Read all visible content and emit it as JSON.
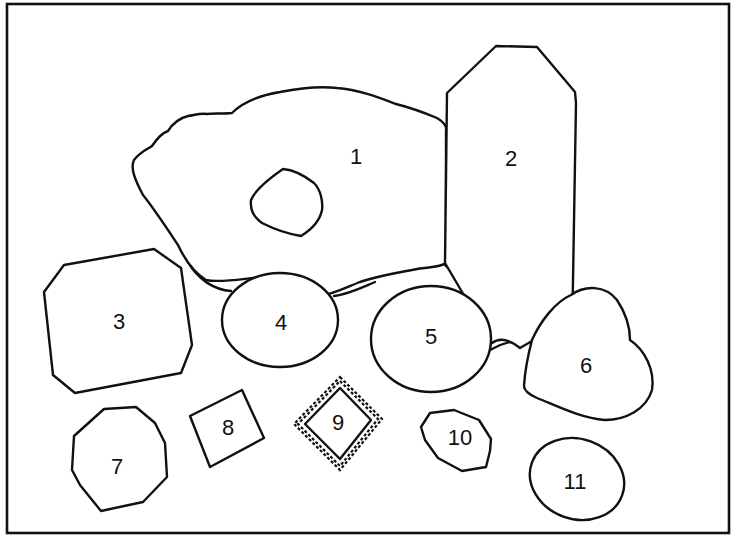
{
  "figure": {
    "frame_color": "#111111",
    "background": "#ffffff",
    "shapes": [
      {
        "id": "1",
        "label": "1",
        "description": "large irregular blob with inner hole"
      },
      {
        "id": "2",
        "label": "2",
        "description": "tall elongated octagon"
      },
      {
        "id": "3",
        "label": "3",
        "description": "large octagon with clipped corners"
      },
      {
        "id": "4",
        "label": "4",
        "description": "ellipse"
      },
      {
        "id": "5",
        "label": "5",
        "description": "ellipse"
      },
      {
        "id": "6",
        "label": "6",
        "description": "heart shape"
      },
      {
        "id": "7",
        "label": "7",
        "description": "irregular polygon"
      },
      {
        "id": "8",
        "label": "8",
        "description": "tilted square"
      },
      {
        "id": "9",
        "label": "9",
        "description": "diamond with beaded border"
      },
      {
        "id": "10",
        "label": "10",
        "description": "small irregular polygon"
      },
      {
        "id": "11",
        "label": "11",
        "description": "ellipse"
      }
    ]
  }
}
